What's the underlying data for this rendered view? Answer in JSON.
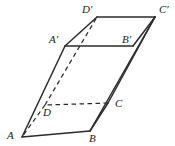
{
  "figure": {
    "background_color": "#ffffff",
    "stroke_color": "#2b2b2b",
    "label_color": "#1a1a1a",
    "width": 175,
    "height": 146
  },
  "vertices": [
    {
      "name": "A",
      "label": "A",
      "x": 22,
      "y": 137,
      "label_x": 7,
      "label_y": 130,
      "hidden": false
    },
    {
      "name": "B",
      "label": "B",
      "x": 90,
      "y": 131,
      "label_x": 89,
      "label_y": 133,
      "hidden": false
    },
    {
      "name": "C",
      "label": "C",
      "x": 108,
      "y": 103,
      "label_x": 115,
      "label_y": 98,
      "hidden": false
    },
    {
      "name": "D",
      "label": "D",
      "x": 45,
      "y": 105,
      "label_x": 43,
      "label_y": 107,
      "hidden": true
    },
    {
      "name": "A'",
      "label": "A′",
      "x": 65,
      "y": 46,
      "label_x": 49,
      "label_y": 34,
      "hidden": false
    },
    {
      "name": "B'",
      "label": "B′",
      "x": 133,
      "y": 46,
      "label_x": 122,
      "label_y": 34,
      "hidden": false
    },
    {
      "name": "C'",
      "label": "C′",
      "x": 155,
      "y": 17,
      "label_x": 159,
      "label_y": 4,
      "hidden": false
    },
    {
      "name": "D'",
      "label": "D′",
      "x": 97,
      "y": 17,
      "label_x": 82,
      "label_y": 4,
      "hidden": false
    }
  ],
  "edges": [
    {
      "name": "edge-A-B",
      "from": "A",
      "to": "B",
      "style": "solid"
    },
    {
      "name": "edge-B-C",
      "from": "B",
      "to": "C",
      "style": "solid"
    },
    {
      "name": "edge-C-D",
      "from": "C",
      "to": "D",
      "style": "hidden"
    },
    {
      "name": "edge-D-A",
      "from": "D",
      "to": "A",
      "style": "hidden"
    },
    {
      "name": "edge-Ap-Bp",
      "from": "A'",
      "to": "B'",
      "style": "solid"
    },
    {
      "name": "edge-Bp-Cp",
      "from": "B'",
      "to": "C'",
      "style": "solid"
    },
    {
      "name": "edge-Cp-Dp",
      "from": "C'",
      "to": "D'",
      "style": "solid"
    },
    {
      "name": "edge-Dp-Ap",
      "from": "D'",
      "to": "A'",
      "style": "solid"
    },
    {
      "name": "edge-A-Ap",
      "from": "A",
      "to": "A'",
      "style": "solid"
    },
    {
      "name": "edge-B-Bp",
      "from": "B",
      "to": "C'",
      "style": "solid"
    },
    {
      "name": "edge-C-Cp",
      "from": "C",
      "to": "C'",
      "style": "solid"
    },
    {
      "name": "edge-D-Dp",
      "from": "D",
      "to": "D'",
      "style": "hidden"
    }
  ]
}
